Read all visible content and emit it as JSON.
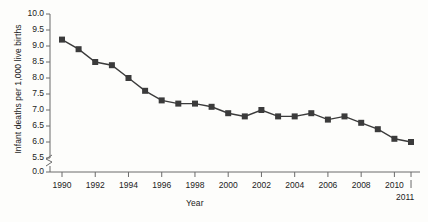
{
  "chart_data": {
    "type": "line",
    "title": "",
    "xlabel": "Year",
    "ylabel": "Infant deaths per 1,000 live births",
    "x": [
      1990,
      1991,
      1992,
      1993,
      1994,
      1995,
      1996,
      1997,
      1998,
      1999,
      2000,
      2001,
      2002,
      2003,
      2004,
      2005,
      2006,
      2007,
      2008,
      2009,
      2010,
      2011
    ],
    "values": [
      9.2,
      8.9,
      8.5,
      8.4,
      8.0,
      7.6,
      7.3,
      7.2,
      7.2,
      7.1,
      6.9,
      6.8,
      7.0,
      6.8,
      6.8,
      6.9,
      6.7,
      6.8,
      6.6,
      6.4,
      6.1,
      6.0
    ],
    "series": [
      {
        "name": "Infant mortality rate",
        "values": [
          9.2,
          8.9,
          8.5,
          8.4,
          8.0,
          7.6,
          7.3,
          7.2,
          7.2,
          7.1,
          6.9,
          6.8,
          7.0,
          6.8,
          6.8,
          6.9,
          6.7,
          6.8,
          6.6,
          6.4,
          6.1,
          6.0
        ]
      }
    ],
    "ytick_labels": [
      "10.0",
      "9.5",
      "9.0",
      "8.5",
      "8.0",
      "7.5",
      "7.0",
      "6.5",
      "6.0",
      "5.5",
      "0.0"
    ],
    "ytick_values": [
      10.0,
      9.5,
      9.0,
      8.5,
      8.0,
      7.5,
      7.0,
      6.5,
      6.0,
      5.5,
      0.0
    ],
    "xtick_labels": [
      "1990",
      "1992",
      "1994",
      "1996",
      "1998",
      "2000",
      "2002",
      "2004",
      "2006",
      "2008",
      "2010"
    ],
    "xtick_values": [
      1990,
      1992,
      1994,
      1996,
      1998,
      2000,
      2002,
      2004,
      2006,
      2008,
      2010
    ],
    "end_tick_label": "2011",
    "ylim": [
      5.5,
      10.0
    ],
    "xlim": [
      1990,
      2011
    ],
    "axis_break": true,
    "grid": false,
    "legend": "none",
    "marker": "square",
    "line_color": "#3b3b3b",
    "marker_color": "#3b3b3b",
    "axis_color": "#6b6b6b",
    "background_color": "#fdfdfb"
  }
}
